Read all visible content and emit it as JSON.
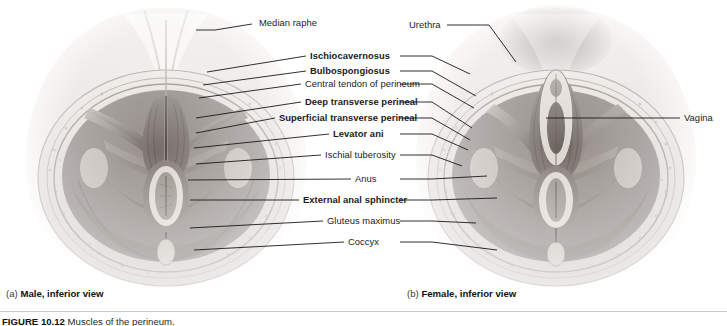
{
  "figure": {
    "labels_left_column": [
      {
        "id": "median-raphe",
        "text": "Median raphe",
        "bold": false,
        "x": 259,
        "y": 18,
        "align": "left",
        "line": [
          [
            196,
            30
          ],
          [
            215,
            30
          ],
          [
            252,
            24
          ]
        ]
      },
      {
        "id": "ischiocavernosus",
        "text": "Ischiocavernosus",
        "bold": true,
        "x": 310,
        "y": 51,
        "align": "left",
        "line": [
          [
            207,
            72
          ],
          [
            306,
            56
          ]
        ]
      },
      {
        "id": "bulbospongiosus",
        "text": "Bulbospongiosus",
        "bold": true,
        "x": 310,
        "y": 66,
        "align": "left",
        "line": [
          [
            203,
            85
          ],
          [
            306,
            71
          ]
        ]
      },
      {
        "id": "central-tendon-of-perineum",
        "text": "Central tendon of perineum",
        "bold": false,
        "x": 305,
        "y": 79,
        "align": "left",
        "line": [
          [
            199,
            98
          ],
          [
            301,
            84
          ]
        ]
      },
      {
        "id": "deep-transverse-perineal",
        "text": "Deep transverse perineal",
        "bold": true,
        "x": 305,
        "y": 97,
        "align": "left",
        "line": [
          [
            196,
            118
          ],
          [
            301,
            102
          ]
        ]
      },
      {
        "id": "superficial-transverse-perineal",
        "text": "Superficial transverse perineal",
        "bold": true,
        "x": 279,
        "y": 113,
        "align": "left",
        "line": [
          [
            196,
            133
          ],
          [
            275,
            118
          ]
        ]
      },
      {
        "id": "levator-ani",
        "text": "Levator ani",
        "bold": true,
        "x": 333,
        "y": 129,
        "align": "left",
        "line": [
          [
            194,
            148
          ],
          [
            329,
            134
          ]
        ]
      },
      {
        "id": "ischial-tuberosity",
        "text": "Ischial tuberosity",
        "bold": false,
        "x": 325,
        "y": 150,
        "align": "left",
        "line": [
          [
            196,
            164
          ],
          [
            321,
            155
          ]
        ]
      },
      {
        "id": "anus",
        "text": "Anus",
        "bold": false,
        "x": 355,
        "y": 174,
        "align": "left",
        "line": [
          [
            188,
            180
          ],
          [
            351,
            179
          ]
        ]
      },
      {
        "id": "external-anal-sphincter",
        "text": "External anal sphincter",
        "bold": true,
        "x": 303,
        "y": 195,
        "align": "left",
        "line": [
          [
            190,
            200
          ],
          [
            299,
            200
          ]
        ]
      },
      {
        "id": "gluteus-maximus",
        "text": "Gluteus maximus",
        "bold": false,
        "x": 327,
        "y": 216,
        "align": "left",
        "line": [
          [
            190,
            228
          ],
          [
            323,
            221
          ]
        ]
      },
      {
        "id": "coccyx",
        "text": "Coccyx",
        "bold": false,
        "x": 348,
        "y": 237,
        "align": "left",
        "line": [
          [
            194,
            250
          ],
          [
            344,
            242
          ]
        ]
      }
    ],
    "labels_right_of_center": [
      {
        "id": "urethra",
        "text": "Urethra",
        "bold": false,
        "x": 409,
        "y": 20,
        "align": "left",
        "line": [
          [
            447,
            25
          ],
          [
            489,
            25
          ],
          [
            516,
            62
          ]
        ]
      },
      {
        "id": "vagina",
        "text": "Vagina",
        "bold": false,
        "x": 684,
        "y": 113,
        "align": "left",
        "line": [
          [
            546,
            118
          ],
          [
            680,
            118
          ]
        ]
      }
    ],
    "leader_right_segments": [
      [
        [
          400,
          56
        ],
        [
          432,
          56
        ],
        [
          470,
          74
        ]
      ],
      [
        [
          400,
          71
        ],
        [
          432,
          71
        ],
        [
          476,
          96
        ]
      ],
      [
        [
          400,
          84
        ],
        [
          432,
          84
        ],
        [
          474,
          108
        ]
      ],
      [
        [
          400,
          102
        ],
        [
          432,
          102
        ],
        [
          472,
          128
        ]
      ],
      [
        [
          400,
          118
        ],
        [
          432,
          118
        ],
        [
          470,
          140
        ]
      ],
      [
        [
          400,
          134
        ],
        [
          432,
          134
        ],
        [
          468,
          150
        ]
      ],
      [
        [
          400,
          155
        ],
        [
          432,
          155
        ],
        [
          462,
          166
        ]
      ],
      [
        [
          400,
          179
        ],
        [
          432,
          179
        ],
        [
          487,
          176
        ]
      ],
      [
        [
          400,
          200
        ],
        [
          432,
          200
        ],
        [
          497,
          198
        ]
      ],
      [
        [
          400,
          221
        ],
        [
          432,
          221
        ],
        [
          476,
          223
        ]
      ],
      [
        [
          400,
          242
        ],
        [
          432,
          242
        ],
        [
          497,
          250
        ]
      ]
    ],
    "captions": [
      {
        "id": "caption-male",
        "tag": "(a)",
        "text": "Male, inferior view",
        "x": 6,
        "y": 288
      },
      {
        "id": "caption-female",
        "tag": "(b)",
        "text": "Female, inferior view",
        "x": 407,
        "y": 288
      }
    ],
    "figure_title": {
      "number": "FIGURE 10.12",
      "text": "Muscles of the perineum."
    }
  },
  "colors": {
    "label_text": "#1b1b1b",
    "leader_line": "#1a1a1a",
    "rule": "#c9c9c9",
    "background": "#ffffff",
    "tissue_light": "#e8e4e0",
    "tissue_mid": "#b9b2ac",
    "tissue_dark": "#6e6661",
    "muscle_dark": "#58504b"
  }
}
